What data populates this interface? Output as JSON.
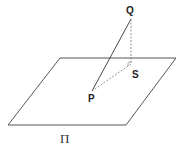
{
  "diagram": {
    "plane_label": "Π",
    "points": {
      "P": "P",
      "Q": "Q",
      "S": "S"
    },
    "colors": {
      "line": "#333333",
      "dashed": "#888888"
    }
  }
}
